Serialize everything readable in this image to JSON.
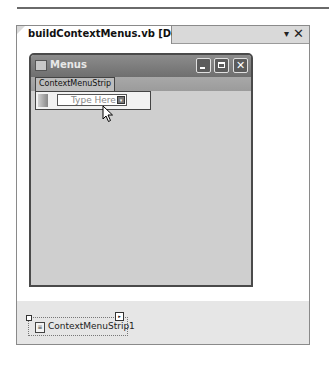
{
  "document_tab": {
    "title": "buildContextMenus.vb [Design]*",
    "dropdown_icon": "▾",
    "close_icon": "✕"
  },
  "form": {
    "title": "Menus",
    "buttons": {
      "minimize": "minimize",
      "maximize": "maximize",
      "close": "✕"
    }
  },
  "context_menu_strip": {
    "label": "ContextMenuStrip",
    "placeholder": "Type Here",
    "dropdown_arrow": "▾"
  },
  "component_tray": {
    "items": [
      {
        "label": "ContextMenuStrip1",
        "smart_tag": "▸"
      }
    ]
  }
}
